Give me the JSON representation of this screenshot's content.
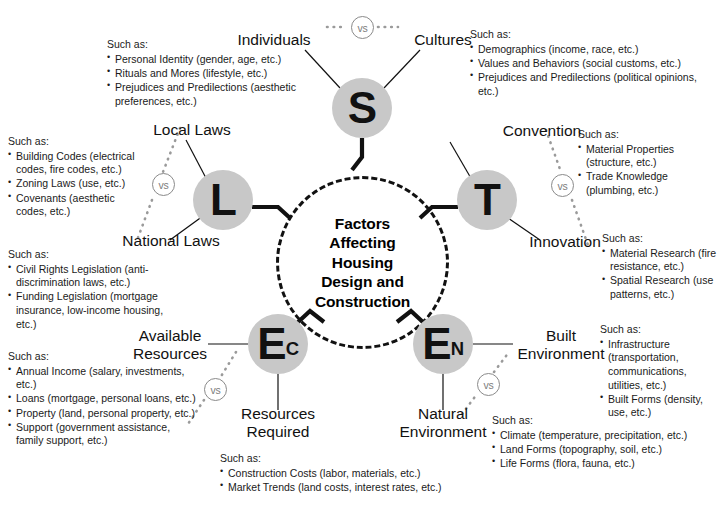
{
  "diagram": {
    "center": {
      "label": "Factors\nAffecting\nHousing\nDesign and\nConstruction"
    },
    "vs_label": "vs",
    "such_as_header": "Such as:",
    "nodes": [
      {
        "id": "S",
        "letter": "S",
        "subscript": ""
      },
      {
        "id": "L",
        "letter": "L",
        "subscript": ""
      },
      {
        "id": "T",
        "letter": "T",
        "subscript": ""
      },
      {
        "id": "EC",
        "letter": "E",
        "subscript": "C"
      },
      {
        "id": "EN",
        "letter": "E",
        "subscript": "N"
      }
    ],
    "endpoints": [
      {
        "id": "individuals",
        "label": "Individuals"
      },
      {
        "id": "cultures",
        "label": "Cultures"
      },
      {
        "id": "local-laws",
        "label": "Local Laws"
      },
      {
        "id": "national-laws",
        "label": "National Laws"
      },
      {
        "id": "convention",
        "label": "Convention"
      },
      {
        "id": "innovation",
        "label": "Innovation"
      },
      {
        "id": "available-resources",
        "label": "Available\nResources"
      },
      {
        "id": "resources-required",
        "label": "Resources\nRequired"
      },
      {
        "id": "built-environment",
        "label": "Built\nEnvironment"
      },
      {
        "id": "natural-environment",
        "label": "Natural\nEnvironment"
      }
    ],
    "detail_blocks": [
      {
        "id": "individuals-details",
        "items": [
          "Personal Identity (gender, age, etc.)",
          "Rituals and Mores (lifestyle, etc.)",
          "Prejudices and Predilections (aesthetic preferences, etc.)"
        ]
      },
      {
        "id": "cultures-details",
        "items": [
          "Demographics (income, race, etc.)",
          "Values and Behaviors (social customs, etc.)",
          "Prejudices and Predilections (political opinions, etc.)"
        ]
      },
      {
        "id": "local-laws-details",
        "items": [
          "Building Codes (electrical codes, fire codes, etc.)",
          "Zoning Laws (use, etc.)",
          "Covenants (aesthetic codes, etc.)"
        ]
      },
      {
        "id": "national-laws-details",
        "items": [
          "Civil Rights Legislation (anti-discrimination laws, etc.)",
          "Funding Legislation (mortgage insurance, low-income housing, etc.)"
        ]
      },
      {
        "id": "convention-details",
        "items": [
          "Material Properties (structure, etc.)",
          "Trade Knowledge (plumbing, etc.)"
        ]
      },
      {
        "id": "innovation-details",
        "items": [
          "Material Research (fire resistance, etc.)",
          "Spatial Research (use patterns, etc.)"
        ]
      },
      {
        "id": "available-resources-details",
        "items": [
          "Annual Income (salary, investments, etc.)",
          "Loans (mortgage, personal loans, etc.)",
          "Property (land, personal property, etc.)",
          "Support (government assistance, family support, etc.)"
        ]
      },
      {
        "id": "resources-required-details",
        "items": [
          "Construction Costs (labor, materials, etc.)",
          "Market Trends (land costs, interest rates, etc.)"
        ]
      },
      {
        "id": "built-environment-details",
        "items": [
          "Infrastructure (transportation, communications, utilities, etc.)",
          "Built Forms (density, use, etc.)"
        ]
      },
      {
        "id": "natural-environment-details",
        "items": [
          "Climate (temperature, precipitation, etc.)",
          "Land Forms (topography, soil, etc.)",
          "Life Forms (flora, fauna, etc.)"
        ]
      }
    ],
    "colors": {
      "node_fill": "#c8c8c8",
      "stroke": "#111111",
      "vs_stroke": "#8a8a8a",
      "background": "#ffffff"
    }
  }
}
